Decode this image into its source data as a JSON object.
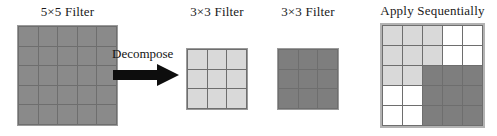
{
  "figure": {
    "caption_hidden": "",
    "panels": [
      {
        "id": "filter5",
        "title": "5×5 Filter",
        "grid": {
          "rows": 5,
          "cols": 5,
          "cells": [
            [
              "#8a8a8a",
              "#8a8a8a",
              "#8a8a8a",
              "#8a8a8a",
              "#8a8a8a"
            ],
            [
              "#8a8a8a",
              "#8a8a8a",
              "#8a8a8a",
              "#8a8a8a",
              "#8a8a8a"
            ],
            [
              "#8a8a8a",
              "#8a8a8a",
              "#8a8a8a",
              "#8a8a8a",
              "#8a8a8a"
            ],
            [
              "#8a8a8a",
              "#8a8a8a",
              "#8a8a8a",
              "#8a8a8a",
              "#8a8a8a"
            ],
            [
              "#8a8a8a",
              "#8a8a8a",
              "#8a8a8a",
              "#8a8a8a",
              "#8a8a8a"
            ]
          ]
        }
      },
      {
        "id": "filter3a",
        "title": "3×3 Filter",
        "grid": {
          "rows": 3,
          "cols": 3,
          "cells": [
            [
              "#d9d9d9",
              "#d9d9d9",
              "#d9d9d9"
            ],
            [
              "#d9d9d9",
              "#d9d9d9",
              "#d9d9d9"
            ],
            [
              "#d9d9d9",
              "#d9d9d9",
              "#d9d9d9"
            ]
          ]
        }
      },
      {
        "id": "filter3b",
        "title": "3×3 Filter",
        "grid": {
          "rows": 3,
          "cols": 3,
          "cells": [
            [
              "#7e7e7e",
              "#7e7e7e",
              "#7e7e7e"
            ],
            [
              "#7e7e7e",
              "#7e7e7e",
              "#7e7e7e"
            ],
            [
              "#7e7e7e",
              "#7e7e7e",
              "#7e7e7e"
            ]
          ]
        }
      },
      {
        "id": "apply",
        "title": "Apply Sequentially",
        "grid": {
          "rows": 5,
          "cols": 5,
          "cells": [
            [
              "#d9d9d9",
              "#d9d9d9",
              "#d9d9d9",
              "#ffffff",
              "#ffffff"
            ],
            [
              "#d9d9d9",
              "#d9d9d9",
              "#d9d9d9",
              "#ffffff",
              "#ffffff"
            ],
            [
              "#d9d9d9",
              "#d9d9d9",
              "#7e7e7e",
              "#7e7e7e",
              "#7e7e7e"
            ],
            [
              "#ffffff",
              "#ffffff",
              "#7e7e7e",
              "#7e7e7e",
              "#7e7e7e"
            ],
            [
              "#ffffff",
              "#ffffff",
              "#7e7e7e",
              "#7e7e7e",
              "#7e7e7e"
            ]
          ]
        }
      }
    ],
    "decompose": {
      "label": "Decompose",
      "arrow_icon": "arrow-right-icon",
      "arrow_color": "#0d0d0d"
    },
    "colors": {
      "medium_gray": "#8a8a8a",
      "light_gray": "#d9d9d9",
      "dark_gray": "#7e7e7e",
      "white": "#ffffff",
      "grid_line": "#6e6e6e",
      "outer_border": "#9a9a9a",
      "apply_border": "#b3b3b3",
      "text": "#1a1a1a"
    }
  }
}
